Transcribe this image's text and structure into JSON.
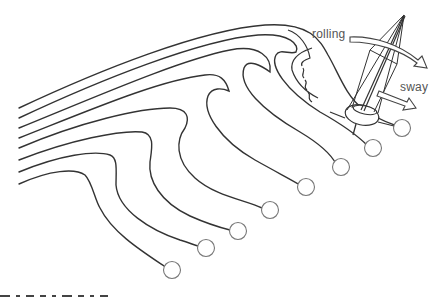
{
  "diagram": {
    "type": "wave-streamlines-with-sailboat",
    "labels": {
      "rolling": "rolling",
      "sway": "sway"
    },
    "streamline_count": 8,
    "particle_circles": [
      {
        "x": 172,
        "y": 270
      },
      {
        "x": 206,
        "y": 248
      },
      {
        "x": 238,
        "y": 231
      },
      {
        "x": 270,
        "y": 210
      },
      {
        "x": 306,
        "y": 187
      },
      {
        "x": 341,
        "y": 167
      },
      {
        "x": 373,
        "y": 148
      },
      {
        "x": 402,
        "y": 128
      }
    ],
    "colors": {
      "line": "#333333",
      "circle": "#777777",
      "label": "#555555",
      "background": "#ffffff"
    },
    "caption": "Clipped caption (illegible)"
  }
}
